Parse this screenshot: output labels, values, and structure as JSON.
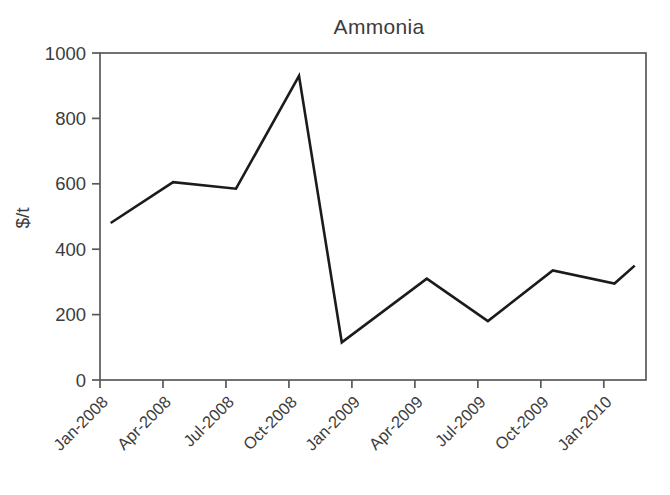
{
  "page": {
    "background_color": "#ffffff"
  },
  "chart_data": {
    "type": "line",
    "title": "Ammonia",
    "xlabel": "",
    "ylabel": "$/t",
    "x_tick_labels": [
      "Jan-2008",
      "Apr-2008",
      "Jul-2008",
      "Oct-2008",
      "Jan-2009",
      "Apr-2009",
      "Jul-2009",
      "Oct-2009",
      "Jan-2010"
    ],
    "y_ticks": [
      0,
      200,
      400,
      600,
      800,
      1000
    ],
    "ylim": [
      0,
      1000
    ],
    "x_axis_range_quarters": [
      0,
      8.67
    ],
    "grid": "off",
    "legend": "none",
    "frame": "full-box",
    "x_tick_label_rotation_deg": -45,
    "series": [
      {
        "name": "Ammonia price",
        "unit": "$/t",
        "points": [
          {
            "period": "Jan-2008",
            "x_quarters": 0.17,
            "value": 480
          },
          {
            "period": "Apr-2008",
            "x_quarters": 1.16,
            "value": 605
          },
          {
            "period": "Jul-2008",
            "x_quarters": 2.16,
            "value": 585
          },
          {
            "period": "Oct-2008",
            "x_quarters": 3.16,
            "value": 930
          },
          {
            "period": "Dec-2008",
            "x_quarters": 3.84,
            "value": 115
          },
          {
            "period": "Apr-2009",
            "x_quarters": 5.19,
            "value": 310
          },
          {
            "period": "Jul-2009",
            "x_quarters": 6.16,
            "value": 180
          },
          {
            "period": "Oct-2009",
            "x_quarters": 7.19,
            "value": 335
          },
          {
            "period": "Jan-2010",
            "x_quarters": 8.17,
            "value": 295
          },
          {
            "period": "Feb-2010",
            "x_quarters": 8.49,
            "value": 350
          }
        ]
      }
    ],
    "colors": {
      "line": "#1b1b1b",
      "axis": "#595959",
      "text": "#3c3c3c",
      "background": "#ffffff"
    },
    "layout": {
      "width": 670,
      "height": 495,
      "plot_left": 100,
      "plot_top": 53,
      "plot_right": 646,
      "plot_bottom": 380,
      "tick_length": 8
    }
  }
}
